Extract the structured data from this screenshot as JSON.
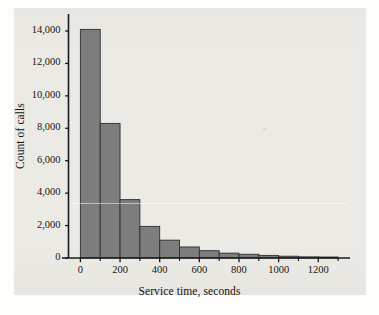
{
  "figure": {
    "background_color": "#eceae5",
    "page_color": "#fdfdfc",
    "bar_fill_color": "#7d7d7d",
    "bar_edge_color": "#2e2e2e",
    "axis_color": "#1a1a1a",
    "text_color": "#16140f"
  },
  "chart_data": {
    "type": "bar",
    "title": "",
    "xlabel": "Service time, seconds",
    "ylabel": "Count of calls",
    "xlim": [
      -60,
      1360
    ],
    "ylim": [
      0,
      14600
    ],
    "grid": false,
    "legend": null,
    "bin_width": 100,
    "x_ticks": [
      0,
      200,
      400,
      600,
      800,
      1000,
      1200
    ],
    "x_tick_labels": [
      "0",
      "200",
      "400",
      "600",
      "800",
      "1000",
      "1200"
    ],
    "x_minor_ticks": [
      100,
      300,
      500,
      700,
      900,
      1100,
      1300
    ],
    "y_ticks": [
      0,
      2000,
      4000,
      6000,
      8000,
      10000,
      12000,
      14000
    ],
    "y_tick_labels": [
      "0",
      "2,000",
      "4,000",
      "6,000",
      "8,000",
      "10,000",
      "12,000",
      "14,000"
    ],
    "bins": [
      {
        "x0": 0,
        "x1": 100,
        "value": 14100
      },
      {
        "x0": 100,
        "x1": 200,
        "value": 8300
      },
      {
        "x0": 200,
        "x1": 300,
        "value": 3600
      },
      {
        "x0": 300,
        "x1": 400,
        "value": 1950
      },
      {
        "x0": 400,
        "x1": 500,
        "value": 1100
      },
      {
        "x0": 500,
        "x1": 600,
        "value": 680
      },
      {
        "x0": 600,
        "x1": 700,
        "value": 450
      },
      {
        "x0": 700,
        "x1": 800,
        "value": 300
      },
      {
        "x0": 800,
        "x1": 900,
        "value": 230
      },
      {
        "x0": 900,
        "x1": 1000,
        "value": 160
      },
      {
        "x0": 1000,
        "x1": 1100,
        "value": 110
      },
      {
        "x0": 1100,
        "x1": 1200,
        "value": 70
      },
      {
        "x0": 1200,
        "x1": 1300,
        "value": 60
      }
    ],
    "categories": [
      "0-100",
      "100-200",
      "200-300",
      "300-400",
      "400-500",
      "500-600",
      "600-700",
      "700-800",
      "800-900",
      "900-1000",
      "1000-1100",
      "1100-1200",
      "1200-1300"
    ],
    "values": [
      14100,
      8300,
      3600,
      1950,
      1100,
      680,
      450,
      300,
      230,
      160,
      110,
      70,
      60
    ]
  }
}
